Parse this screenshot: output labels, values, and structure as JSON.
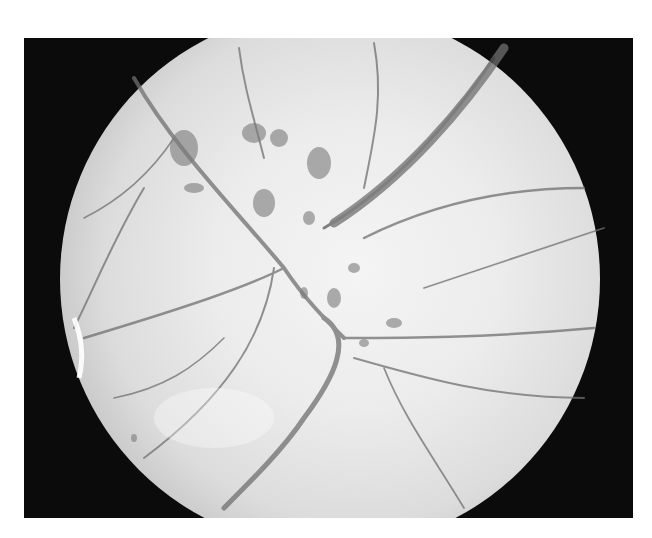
{
  "image": {
    "type": "fundus-photograph",
    "description": "Grayscale retinal fundus photograph, circular field of view on black background, showing optic disc region with vessels and dark hemorrhagic/pigmented patches",
    "colors": {
      "page_background": "#ffffff",
      "frame_background": "#0b0b0b",
      "retina_bright": "#f4f4f4",
      "retina_edge": "#8a8a8a",
      "vessel": "#6e6e6e",
      "lesion": "#7a7a7a"
    }
  }
}
